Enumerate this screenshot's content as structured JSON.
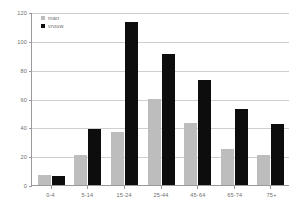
{
  "chart_data": {
    "type": "bar",
    "title": "",
    "subtitle": "",
    "xlabel": "",
    "ylabel": "",
    "categories": [
      "0-4",
      "5-14",
      "15-24",
      "25-44",
      "45-64",
      "65-74",
      "75+"
    ],
    "series": [
      {
        "name": "man",
        "color": "#bdbdbd",
        "values": [
          7,
          21,
          37,
          60,
          43,
          25,
          21
        ]
      },
      {
        "name": "vrouw",
        "color": "#0d0d0d",
        "values": [
          6,
          39,
          113,
          91,
          73,
          53,
          42
        ]
      }
    ],
    "ylim": [
      0,
      120
    ],
    "yticks": [
      0,
      20,
      40,
      60,
      80,
      100,
      120
    ],
    "ytick_labels": [
      "0",
      "20",
      "40",
      "60",
      "80",
      "100",
      "120"
    ],
    "grid": true,
    "grid_axis": "y",
    "legend_position": "top-left",
    "annotations": []
  },
  "legend": {
    "items": [
      {
        "label": "man"
      },
      {
        "label": "vrouw"
      }
    ]
  },
  "colors": {
    "series_man": "#bdbdbd",
    "series_vrouw": "#0d0d0d",
    "gridline": "#cfcfcf",
    "axis": "#9a9a9a",
    "tick_text": "#6d6d6d",
    "background": "#ffffff"
  }
}
